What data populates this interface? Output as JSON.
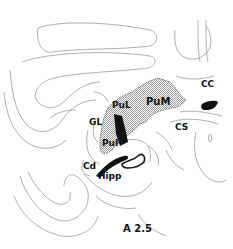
{
  "figure": {
    "section_label": "A 2.5",
    "colors": {
      "outline": "#9a9a9a",
      "shade": "#cfcfcf",
      "dark": "#111111",
      "background": "#ffffff"
    }
  },
  "labels": {
    "pum": "PuM",
    "pul_upper": "PuL",
    "gl": "GL",
    "pul_lower": "PuI",
    "cd": "Cd",
    "hipp": "Hipp",
    "cc": "CC",
    "cs": "CS",
    "section": "A 2.5"
  }
}
